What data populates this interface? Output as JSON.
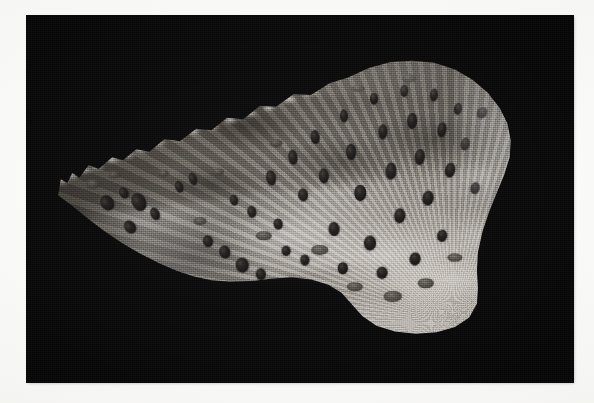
{
  "page": {
    "background_color": "#f8f8f6",
    "width": 594,
    "height": 403,
    "bleed_text_top": "",
    "bleed_text_bottom": ""
  },
  "plate": {
    "name": "specimen-photograph",
    "background_color": "#050505",
    "left": 27,
    "top": 16,
    "width": 546,
    "height": 366,
    "caption": "",
    "scale_bar": "",
    "magnification_label": "",
    "figure_number": ""
  },
  "specimen": {
    "description": "Grayscale photomicrograph of a wedge-shaped sectioned specimen on a black background",
    "surface_tone_light": "#b9b4ad",
    "surface_tone_mid": "#8e8982",
    "surface_tone_dark": "#555049",
    "pit_color": "#1a1715",
    "orientation": "apex at left, broad crenulated margin upper right",
    "features": {
      "upper_margin": "crenulated / scalloped bright rim",
      "surface": "granular fibrous cortex with radiating striae",
      "pits": "dark elongated foramina / vascular canals",
      "lower_right": "coarse ridged trabecular texture"
    }
  },
  "foramina": [
    {
      "x": 14.6,
      "y": 51.2,
      "w": 2.3,
      "h": 4.4,
      "rot": -34
    },
    {
      "x": 17.8,
      "y": 48.4,
      "w": 1.7,
      "h": 3.4,
      "rot": -30
    },
    {
      "x": 20.6,
      "y": 50.8,
      "w": 2.6,
      "h": 5.2,
      "rot": -28
    },
    {
      "x": 23.4,
      "y": 54.0,
      "w": 1.6,
      "h": 3.6,
      "rot": -26
    },
    {
      "x": 18.9,
      "y": 57.6,
      "w": 2.0,
      "h": 3.8,
      "rot": -38
    },
    {
      "x": 27.8,
      "y": 46.8,
      "w": 1.4,
      "h": 3.4,
      "rot": -22
    },
    {
      "x": 30.4,
      "y": 44.6,
      "w": 1.5,
      "h": 3.6,
      "rot": -20
    },
    {
      "x": 33.2,
      "y": 61.4,
      "w": 1.9,
      "h": 3.2,
      "rot": -18
    },
    {
      "x": 36.2,
      "y": 64.6,
      "w": 2.1,
      "h": 3.6,
      "rot": -14
    },
    {
      "x": 39.4,
      "y": 68.0,
      "w": 2.3,
      "h": 4.0,
      "rot": -10
    },
    {
      "x": 42.8,
      "y": 70.4,
      "w": 1.9,
      "h": 3.2,
      "rot": -6
    },
    {
      "x": 38.0,
      "y": 50.4,
      "w": 1.5,
      "h": 3.0,
      "rot": -16
    },
    {
      "x": 41.2,
      "y": 53.6,
      "w": 1.7,
      "h": 3.4,
      "rot": -12
    },
    {
      "x": 44.6,
      "y": 44.2,
      "w": 1.8,
      "h": 4.2,
      "rot": -10
    },
    {
      "x": 46.0,
      "y": 56.8,
      "w": 1.6,
      "h": 3.0,
      "rot": -8
    },
    {
      "x": 48.8,
      "y": 38.4,
      "w": 1.7,
      "h": 4.0,
      "rot": -8
    },
    {
      "x": 50.6,
      "y": 48.8,
      "w": 1.8,
      "h": 3.6,
      "rot": -6
    },
    {
      "x": 52.8,
      "y": 33.0,
      "w": 1.6,
      "h": 3.8,
      "rot": -6
    },
    {
      "x": 54.4,
      "y": 43.6,
      "w": 1.9,
      "h": 4.2,
      "rot": -4
    },
    {
      "x": 56.2,
      "y": 58.2,
      "w": 2.0,
      "h": 3.8,
      "rot": -2
    },
    {
      "x": 58.0,
      "y": 27.4,
      "w": 1.5,
      "h": 3.6,
      "rot": -4
    },
    {
      "x": 59.4,
      "y": 37.2,
      "w": 1.8,
      "h": 4.4,
      "rot": -2
    },
    {
      "x": 61.0,
      "y": 48.4,
      "w": 2.1,
      "h": 4.4,
      "rot": 0
    },
    {
      "x": 62.8,
      "y": 62.0,
      "w": 2.2,
      "h": 4.0,
      "rot": 2
    },
    {
      "x": 63.6,
      "y": 22.6,
      "w": 1.5,
      "h": 3.4,
      "rot": 0
    },
    {
      "x": 65.2,
      "y": 31.8,
      "w": 1.7,
      "h": 4.2,
      "rot": 2
    },
    {
      "x": 66.6,
      "y": 42.4,
      "w": 2.0,
      "h": 4.6,
      "rot": 3
    },
    {
      "x": 68.4,
      "y": 54.6,
      "w": 2.1,
      "h": 4.2,
      "rot": 4
    },
    {
      "x": 69.0,
      "y": 20.4,
      "w": 1.4,
      "h": 3.4,
      "rot": 2
    },
    {
      "x": 70.6,
      "y": 28.8,
      "w": 1.8,
      "h": 4.4,
      "rot": 4
    },
    {
      "x": 72.0,
      "y": 38.6,
      "w": 1.9,
      "h": 4.4,
      "rot": 6
    },
    {
      "x": 73.4,
      "y": 49.6,
      "w": 2.0,
      "h": 4.0,
      "rot": 8
    },
    {
      "x": 74.6,
      "y": 21.6,
      "w": 1.5,
      "h": 3.6,
      "rot": 5
    },
    {
      "x": 76.0,
      "y": 31.2,
      "w": 1.7,
      "h": 4.2,
      "rot": 8
    },
    {
      "x": 77.4,
      "y": 42.0,
      "w": 1.8,
      "h": 4.0,
      "rot": 10
    },
    {
      "x": 79.0,
      "y": 25.4,
      "w": 1.5,
      "h": 3.4,
      "rot": 9
    },
    {
      "x": 80.2,
      "y": 35.0,
      "w": 1.6,
      "h": 3.6,
      "rot": 12
    },
    {
      "x": 83.4,
      "y": 26.4,
      "w": 1.9,
      "h": 3.4,
      "rot": 34
    },
    {
      "x": 82.0,
      "y": 47.0,
      "w": 1.6,
      "h": 3.2,
      "rot": 14
    },
    {
      "x": 47.4,
      "y": 64.2,
      "w": 1.6,
      "h": 2.8,
      "rot": -6
    },
    {
      "x": 51.0,
      "y": 66.8,
      "w": 1.7,
      "h": 3.0,
      "rot": -4
    },
    {
      "x": 57.8,
      "y": 68.8,
      "w": 1.9,
      "h": 3.2,
      "rot": 0
    },
    {
      "x": 65.0,
      "y": 70.2,
      "w": 2.0,
      "h": 3.4,
      "rot": 4
    },
    {
      "x": 71.0,
      "y": 66.4,
      "w": 2.0,
      "h": 3.6,
      "rot": 8
    },
    {
      "x": 76.0,
      "y": 60.2,
      "w": 1.8,
      "h": 3.4,
      "rot": 12
    }
  ],
  "depressions": [
    {
      "x": 12.0,
      "y": 46.0,
      "w": 2.6,
      "h": 2.4
    },
    {
      "x": 16.0,
      "y": 43.4,
      "w": 2.2,
      "h": 2.0
    },
    {
      "x": 25.0,
      "y": 43.0,
      "w": 2.0,
      "h": 1.8
    },
    {
      "x": 31.6,
      "y": 56.0,
      "w": 2.4,
      "h": 2.2
    },
    {
      "x": 35.0,
      "y": 42.6,
      "w": 2.2,
      "h": 2.0
    },
    {
      "x": 43.4,
      "y": 60.0,
      "w": 3.0,
      "h": 2.6
    },
    {
      "x": 45.6,
      "y": 34.6,
      "w": 2.4,
      "h": 2.2
    },
    {
      "x": 53.6,
      "y": 64.0,
      "w": 3.2,
      "h": 2.8
    },
    {
      "x": 60.0,
      "y": 74.0,
      "w": 3.0,
      "h": 2.6
    },
    {
      "x": 67.0,
      "y": 76.6,
      "w": 3.4,
      "h": 2.8
    },
    {
      "x": 73.0,
      "y": 73.0,
      "w": 3.0,
      "h": 2.6
    },
    {
      "x": 78.4,
      "y": 66.0,
      "w": 2.8,
      "h": 2.4
    },
    {
      "x": 70.0,
      "y": 17.0,
      "w": 2.6,
      "h": 2.0
    },
    {
      "x": 60.6,
      "y": 19.8,
      "w": 2.4,
      "h": 1.8
    }
  ],
  "margin_nodules": [
    {
      "x": 6.4,
      "y": 45.6,
      "s": 3.4
    },
    {
      "x": 8.6,
      "y": 44.0,
      "s": 3.0
    },
    {
      "x": 10.8,
      "y": 42.6,
      "s": 3.2
    },
    {
      "x": 13.2,
      "y": 41.4,
      "s": 2.8
    },
    {
      "x": 15.8,
      "y": 39.6,
      "s": 3.0
    },
    {
      "x": 18.6,
      "y": 38.4,
      "s": 2.8
    },
    {
      "x": 21.4,
      "y": 36.8,
      "s": 3.0
    },
    {
      "x": 24.4,
      "y": 35.0,
      "s": 2.8
    },
    {
      "x": 27.6,
      "y": 33.6,
      "s": 3.0
    },
    {
      "x": 30.8,
      "y": 31.8,
      "s": 2.8
    },
    {
      "x": 34.2,
      "y": 30.6,
      "s": 3.0
    },
    {
      "x": 37.6,
      "y": 28.8,
      "s": 2.8
    },
    {
      "x": 41.0,
      "y": 27.0,
      "s": 3.0
    },
    {
      "x": 44.6,
      "y": 25.4,
      "s": 2.8
    },
    {
      "x": 48.2,
      "y": 23.2,
      "s": 3.0
    },
    {
      "x": 52.0,
      "y": 21.4,
      "s": 2.8
    }
  ]
}
